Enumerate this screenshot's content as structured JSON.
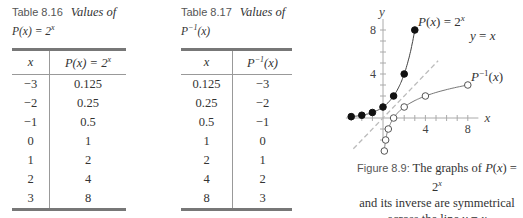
{
  "table1": {
    "label": "Table 8.16",
    "title": "Values of",
    "subtitle": "P(x) = 2^x",
    "columns": [
      "x",
      "P(x) = 2^x"
    ],
    "rows": [
      [
        "−3",
        "0.125"
      ],
      [
        "−2",
        "0.25"
      ],
      [
        "−1",
        "0.5"
      ],
      [
        "0",
        "1"
      ],
      [
        "1",
        "2"
      ],
      [
        "2",
        "4"
      ],
      [
        "3",
        "8"
      ]
    ]
  },
  "table2": {
    "label": "Table 8.17",
    "title": "Values of",
    "subtitle": "P^−1(x)",
    "columns": [
      "x",
      "P^−1(x)"
    ],
    "rows": [
      [
        "0.125",
        "−3"
      ],
      [
        "0.25",
        "−2"
      ],
      [
        "0.5",
        "−1"
      ],
      [
        "1",
        "0"
      ],
      [
        "2",
        "1"
      ],
      [
        "4",
        "2"
      ],
      [
        "8",
        "3"
      ]
    ]
  },
  "figure": {
    "label": "Figure 8.9:",
    "caption_line1": "The graphs of P(x) = 2^x",
    "caption_line2": "and its inverse are symmetrical",
    "caption_line3": "across the line y = x",
    "axis_x_label": "x",
    "axis_y_label": "y",
    "curve_label_p": "P(x) = 2^x",
    "curve_label_inv": "P^−1(x)",
    "line_label": "y = x",
    "x_ticks": [
      "4",
      "8"
    ],
    "y_ticks": [
      "4",
      "8"
    ]
  },
  "chart_data": {
    "type": "line",
    "xlabel": "x",
    "ylabel": "y",
    "xlim": [
      -3.5,
      9
    ],
    "ylim": [
      -2.2,
      9
    ],
    "x_tick_labels": [
      4,
      8
    ],
    "y_tick_labels": [
      4,
      8
    ],
    "grid": false,
    "series": [
      {
        "name": "P(x) = 2^x",
        "marker": "filled",
        "x": [
          -3,
          -2,
          -1,
          0,
          1,
          2,
          3
        ],
        "y": [
          0.125,
          0.25,
          0.5,
          1,
          2,
          4,
          8
        ]
      },
      {
        "name": "P^-1(x)",
        "marker": "open",
        "x": [
          0.125,
          0.25,
          0.5,
          1,
          2,
          4,
          8
        ],
        "y": [
          -3,
          -2,
          -1,
          0,
          1,
          2,
          3
        ]
      },
      {
        "name": "y = x",
        "style": "dashed",
        "x": [
          -2.8,
          5.2
        ],
        "y": [
          -2.8,
          5.2
        ]
      }
    ]
  }
}
